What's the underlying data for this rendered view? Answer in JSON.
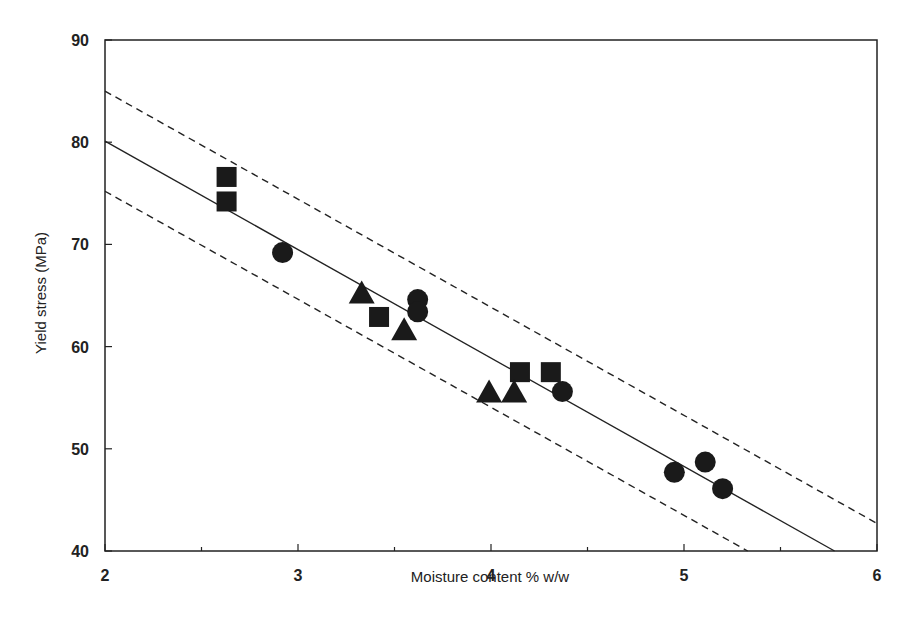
{
  "chart_data": {
    "type": "scatter",
    "title": "",
    "xlabel": "Moisture content % w/w",
    "ylabel": "Yield stress (MPa)",
    "xlim": [
      2,
      6
    ],
    "ylim": [
      40,
      90
    ],
    "xticks": [
      2,
      3,
      4,
      5,
      6
    ],
    "yticks": [
      40,
      50,
      60,
      70,
      80,
      90
    ],
    "grid": false,
    "legend": "none",
    "series": [
      {
        "name": "squares",
        "marker": "square",
        "points": [
          [
            2.63,
            76.6
          ],
          [
            2.63,
            74.2
          ],
          [
            3.42,
            62.9
          ],
          [
            4.15,
            57.5
          ],
          [
            4.31,
            57.5
          ]
        ]
      },
      {
        "name": "circles",
        "marker": "circle",
        "points": [
          [
            2.92,
            69.2
          ],
          [
            3.62,
            64.6
          ],
          [
            3.62,
            63.4
          ],
          [
            4.37,
            55.6
          ],
          [
            4.95,
            47.7
          ],
          [
            5.11,
            48.7
          ],
          [
            5.2,
            46.1
          ]
        ]
      },
      {
        "name": "triangles",
        "marker": "triangle",
        "points": [
          [
            3.33,
            65.2
          ],
          [
            3.55,
            61.6
          ],
          [
            3.99,
            55.5
          ],
          [
            4.12,
            55.5
          ]
        ]
      }
    ],
    "lines": [
      {
        "name": "regression",
        "style": "solid",
        "points": [
          [
            2,
            80.1
          ],
          [
            5.78,
            40
          ]
        ]
      },
      {
        "name": "upper-bound",
        "style": "dashed",
        "points": [
          [
            2,
            85.0
          ],
          [
            6,
            42.7
          ]
        ]
      },
      {
        "name": "lower-bound",
        "style": "dashed",
        "points": [
          [
            2,
            75.2
          ],
          [
            5.33,
            40
          ]
        ]
      }
    ]
  },
  "axes": {
    "xlabel": "Moisture content % w/w",
    "ylabel": "Yield stress (MPa)"
  }
}
